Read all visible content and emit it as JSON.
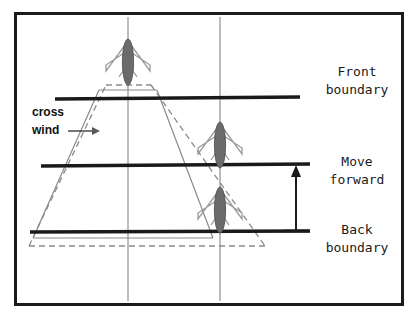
{
  "figure": {
    "type": "technical-diagram",
    "colors": {
      "frame": "#1b1b1b",
      "boundary_line": "#1a1a1a",
      "fuselage": "#6b6b6b",
      "fuselage_outline": "#3a3a3a",
      "wing": "#8f8f8f",
      "cone_solid": "#8a8a8a",
      "cone_dashed": "#8a8a8a",
      "axis_line": "#9a9a9a",
      "arrow": "#1a1a1a",
      "background": "#ffffff"
    },
    "frame": {
      "x": 14,
      "y": 12,
      "width": 389,
      "height": 293,
      "stroke_width": 3
    },
    "labels": {
      "front_boundary": {
        "line1": "Front",
        "line2": "boundary",
        "x": 355,
        "y1": 72,
        "y2": 90
      },
      "move_forward": {
        "line1": "Move",
        "line2": "forward",
        "x": 355,
        "y1": 163,
        "y2": 181
      },
      "back_boundary": {
        "line1": "Back",
        "line2": "boundary",
        "x": 355,
        "y1": 231,
        "y2": 249
      },
      "cross_wind": {
        "line1": "cross",
        "line2": "wind",
        "x": 32,
        "y1": 116,
        "y2": 133
      }
    },
    "boundaries": [
      {
        "name": "front-boundary-line",
        "x1": 55,
        "x2": 300,
        "y": 99,
        "stroke_width": 3
      },
      {
        "name": "move-forward-line",
        "x1": 41,
        "x2": 310,
        "y": 165,
        "stroke_width": 3
      },
      {
        "name": "back-boundary-line",
        "x1": 30,
        "x2": 310,
        "y": 231,
        "stroke_width": 3
      }
    ],
    "axes": [
      {
        "name": "left-vertical-axis",
        "x": 128,
        "y1": 16,
        "y2": 301
      },
      {
        "name": "right-vertical-axis",
        "x": 220,
        "y1": 16,
        "y2": 301
      }
    ],
    "aircraft": [
      {
        "name": "aircraft-front",
        "cx": 128,
        "cy": 62,
        "scale": 1.0
      },
      {
        "name": "aircraft-middle",
        "cx": 220,
        "cy": 145,
        "scale": 1.0
      },
      {
        "name": "aircraft-back",
        "cx": 220,
        "cy": 210,
        "scale": 1.0
      }
    ],
    "cone_solid": {
      "name": "solid-view-cone",
      "points": "99,90 157,90 210,238 32,238"
    },
    "cone_dashed": {
      "name": "dashed-view-cone",
      "points": "105,85 152,85 264,245 28,245"
    },
    "move_forward_arrow": {
      "name": "move-forward-measure-arrow",
      "x": 296,
      "y_top": 168,
      "y_bottom": 231,
      "cap_half_width": 14
    },
    "cross_wind_arrow": {
      "name": "cross-wind-direction-arrow",
      "x1": 68,
      "x2": 98,
      "y": 131
    }
  }
}
